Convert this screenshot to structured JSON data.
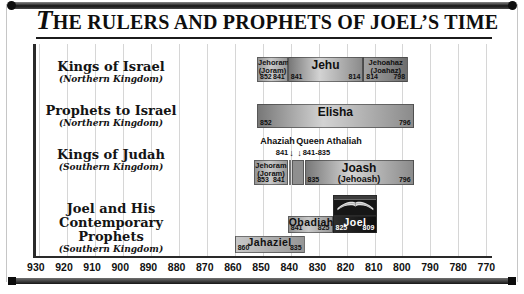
{
  "header": {
    "title_lead": "T",
    "title_rest": "HE RULERS AND PROPHETS OF JOEL’S TIME",
    "title_full": "The Rulers and Prophets of Joel’s Time"
  },
  "icons": {
    "down_arrow": "↓"
  },
  "palette": {
    "frame_dark": "#1b1b1b",
    "gridline": "#d6d6d6",
    "bar_light": "#d3d3d3",
    "bar_mid": "#9a9a9a",
    "bar_dark": "#6e6e6e",
    "joel_bar": "#161616",
    "text_dark": "#101010",
    "text_light": "#ffffff"
  },
  "chart_data": {
    "type": "bar",
    "subtype": "horizontal-timeline",
    "title": "The Rulers and Prophets of Joel’s Time",
    "axis": {
      "unit": "BC, decreasing left to right",
      "ticks": [
        930,
        920,
        910,
        900,
        890,
        880,
        870,
        860,
        850,
        840,
        830,
        820,
        810,
        800,
        790,
        780,
        770
      ],
      "left_year": 931,
      "right_year": 768,
      "grid": true
    },
    "rows": [
      {
        "label": "Kings of Israel",
        "sublabel": "(Northern Kingdom)",
        "bars": [
          {
            "name": "Jehoram",
            "name2": "(Joram)",
            "start": 852,
            "end": 841,
            "style": "mid",
            "small_name": true
          },
          {
            "name": "Jehu",
            "start": 841,
            "end": 814,
            "style": "shine"
          },
          {
            "name": "Jehoahaz",
            "name2": "(Joahaz)",
            "start": 814,
            "end": 798,
            "style": "dark",
            "small_name": true
          }
        ]
      },
      {
        "label": "Prophets to Israel",
        "sublabel": "(Northern Kingdom)",
        "bars": [
          {
            "name": "Elisha",
            "start": 852,
            "end": 796,
            "style": "shine"
          }
        ]
      },
      {
        "label": "Kings of Judah",
        "sublabel": "(Southern Kingdom)",
        "annotations": [
          {
            "name": "Ahaziah",
            "dates": "841",
            "anchor_year": 838.5,
            "align": "right"
          },
          {
            "name": "Queen Athaliah",
            "dates": "841-835",
            "anchor_year": 838,
            "align": "left"
          }
        ],
        "bars": [
          {
            "name": "Jehoram",
            "name2": "(Joram)",
            "start": 853,
            "end": 841,
            "style": "mid",
            "small_name": true
          },
          {
            "name": "Ahaziah",
            "start": 840.7,
            "end": 839.9,
            "style": "sliver_light",
            "hide_label": true
          },
          {
            "name": "Athaliah",
            "start": 839.6,
            "end": 835.3,
            "style": "sliver_dark",
            "hide_label": true
          },
          {
            "name": "Joash",
            "name2": "(Jehoash)",
            "start": 835,
            "end": 796,
            "style": "shine"
          }
        ]
      },
      {
        "label": "Joel and His Contemporary Prophets",
        "sublabel": "(Southern Kingdom)",
        "bars": [
          {
            "name": "Jahaziel",
            "start": 860,
            "end": 835,
            "style": "light",
            "lane": 2
          },
          {
            "name": "Obadiah",
            "start": 841,
            "end": 825,
            "style": "mid",
            "lane": 1
          },
          {
            "name": "Joel",
            "start": 825,
            "end": 809,
            "style": "joel",
            "lane": 1,
            "photo": true
          }
        ]
      }
    ]
  }
}
